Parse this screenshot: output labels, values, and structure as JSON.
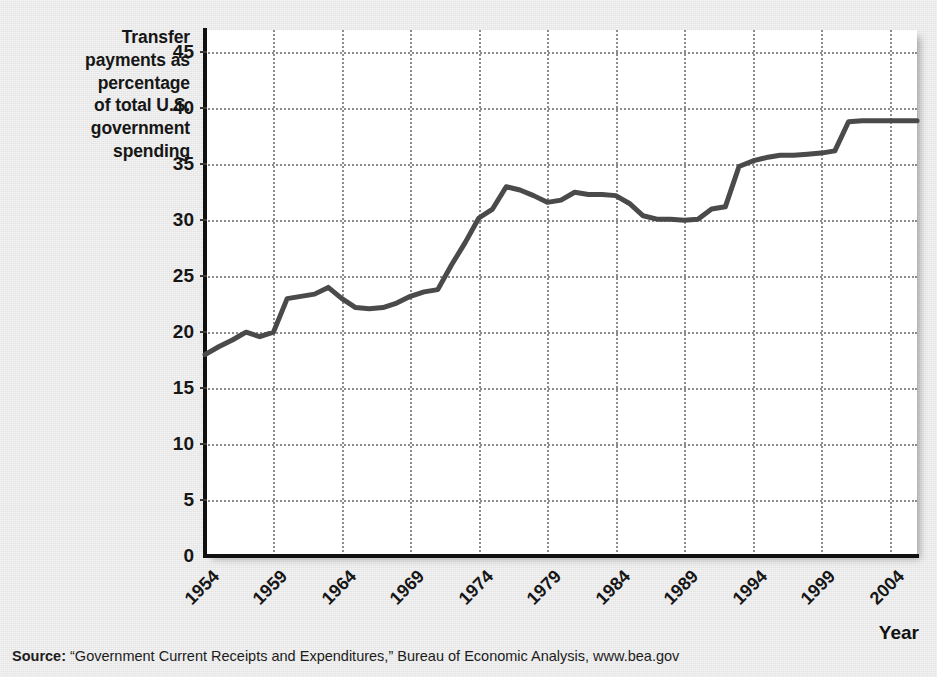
{
  "axes": {
    "y_title": "Transfer payments as percentage of total U.S. government spending",
    "y_title_lines": [
      "Transfer",
      "payments as",
      "percentage",
      "of total U.S.",
      "government",
      "spending"
    ],
    "x_title": "Year"
  },
  "source": {
    "label": "Source:",
    "text": "“Government Current Receipts and Expenditures,” Bureau of Economic Analysis, www.bea.gov"
  },
  "colors": {
    "line": "#4a4a4a",
    "axis": "#111111",
    "grid": "#8c8c8c",
    "plot_background": "#ffffff",
    "page_background": "#e9e9e9",
    "text": "#161616"
  },
  "chart_data": {
    "type": "line",
    "title": "",
    "xlabel": "Year",
    "ylabel": "Transfer payments as percentage of total U.S. government spending",
    "xlim": [
      1954,
      2006
    ],
    "ylim": [
      0,
      47
    ],
    "grid": true,
    "legend": "none",
    "ytick_labels": [
      "0",
      "5",
      "10",
      "15",
      "20",
      "25",
      "30",
      "35",
      "40",
      "45"
    ],
    "yticks": [
      0,
      5,
      10,
      15,
      20,
      25,
      30,
      35,
      40,
      45
    ],
    "xtick_labels": [
      "1954",
      "1959",
      "1964",
      "1969",
      "1974",
      "1979",
      "1984",
      "1989",
      "1994",
      "1999",
      "2004"
    ],
    "xticks": [
      1954,
      1959,
      1964,
      1969,
      1974,
      1979,
      1984,
      1989,
      1994,
      1999,
      2004
    ],
    "series": [
      {
        "name": "Transfer payments as percentage of total U.S. government spending",
        "x": [
          1954,
          1955,
          1956,
          1957,
          1958,
          1959,
          1960,
          1961,
          1962,
          1963,
          1964,
          1965,
          1966,
          1967,
          1968,
          1969,
          1970,
          1971,
          1972,
          1973,
          1974,
          1975,
          1976,
          1977,
          1978,
          1979,
          1980,
          1981,
          1982,
          1983,
          1984,
          1985,
          1986,
          1987,
          1988,
          1989,
          1990,
          1991,
          1992,
          1993,
          1994,
          1995,
          1996,
          1997,
          1998,
          1999,
          2000,
          2001,
          2002,
          2003,
          2004,
          2005,
          2006
        ],
        "values": [
          18.0,
          18.7,
          19.3,
          20.0,
          19.6,
          20.0,
          23.0,
          23.2,
          23.4,
          24.0,
          23.0,
          22.2,
          22.1,
          22.2,
          22.6,
          23.2,
          23.6,
          23.8,
          26.0,
          28.0,
          30.2,
          31.0,
          33.0,
          32.7,
          32.2,
          31.6,
          31.8,
          32.5,
          32.3,
          32.3,
          32.2,
          31.5,
          30.4,
          30.1,
          30.1,
          30.0,
          30.1,
          31.0,
          31.2,
          34.8,
          35.3,
          35.6,
          35.8,
          35.8,
          35.9,
          36.0,
          36.2,
          38.8,
          38.9,
          38.9,
          38.9,
          38.9,
          38.9
        ]
      }
    ]
  }
}
